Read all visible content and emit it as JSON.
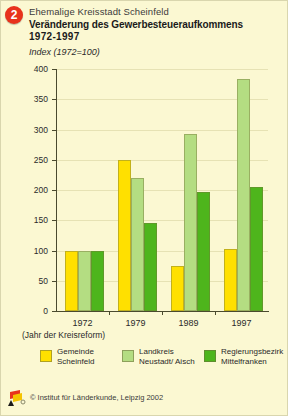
{
  "header": {
    "badge_number": "2",
    "subtitle": "Ehemalige Kreisstadt Scheinfeld",
    "title_line1": "Veränderung des Gewerbesteueraufkommens",
    "title_line2": "1972-1997"
  },
  "footer": {
    "credit": "© Institut für Länderkunde, Leipzig 2002",
    "logo_icon": "ifl-flag-logo"
  },
  "notes": {
    "reform": "(Jahr der Kreisreform)"
  },
  "colors": {
    "series_gemeinde": "#ffe000",
    "series_landkreis": "#b4dd82",
    "series_regierungsbezirk": "#4eb51c",
    "background": "#fbf8d2",
    "badge": "#e8321c",
    "grid": "#e6e2b4",
    "axis": "#4a4a2e"
  },
  "chart_data": {
    "type": "bar",
    "subtitle": "Ehemalige Kreisstadt Scheinfeld",
    "ylabel": "Index (1972=100)",
    "xlabel": "",
    "ylim": [
      0,
      400
    ],
    "yticks": [
      0,
      50,
      100,
      150,
      200,
      250,
      300,
      350,
      400
    ],
    "ytick_labels": [
      "0",
      "50",
      "100",
      "150",
      "200",
      "250",
      "300",
      "350",
      "400"
    ],
    "grid": true,
    "legend_position": "bottom",
    "categories": [
      "1972",
      "1979",
      "1989",
      "1997"
    ],
    "series": [
      {
        "name": "Gemeinde Scheinfeld",
        "legend_line1": "Gemeinde",
        "legend_line2": "Scheinfeld",
        "color": "#ffe000",
        "values": [
          100,
          250,
          75,
          103
        ]
      },
      {
        "name": "Landkreis Neustadt/Aisch",
        "legend_line1": "Landkreis",
        "legend_line2": "Neustadt/ Aisch",
        "color": "#b4dd82",
        "values": [
          100,
          220,
          293,
          383
        ]
      },
      {
        "name": "Regierungsbezirk Mittelfranken",
        "legend_line1": "Regierungsbezirk",
        "legend_line2": "Mittelfranken",
        "color": "#4eb51c",
        "values": [
          100,
          145,
          196,
          205
        ]
      }
    ]
  }
}
